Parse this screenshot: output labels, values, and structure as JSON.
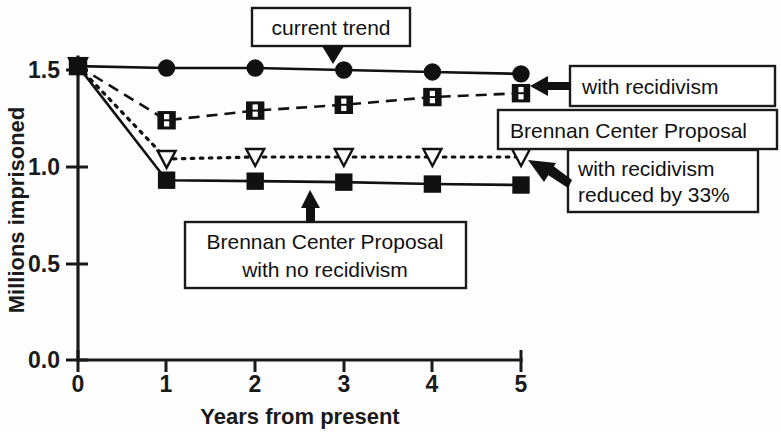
{
  "chart_data": {
    "type": "line",
    "title": "",
    "xlabel": "Years from present",
    "ylabel": "Millions imprisoned",
    "x": [
      0,
      1,
      2,
      3,
      4,
      5
    ],
    "xlim": [
      0,
      5
    ],
    "ylim": [
      0.0,
      1.6
    ],
    "xticks": [
      "0",
      "1",
      "2",
      "3",
      "4",
      "5"
    ],
    "yticks": [
      "0.0",
      "0.5",
      "1.0",
      "1.5"
    ],
    "ytick_values": [
      0.0,
      0.5,
      1.0,
      1.5
    ],
    "grid": false,
    "legend": "annotations",
    "series": [
      {
        "name": "current trend",
        "marker": "filled-circle",
        "linestyle": "solid",
        "values": [
          1.52,
          1.51,
          1.51,
          1.5,
          1.49,
          1.48
        ]
      },
      {
        "name": "Brennan Center Proposal with recidivism",
        "marker": "open-square-split",
        "linestyle": "dashed",
        "values": [
          1.52,
          1.24,
          1.29,
          1.32,
          1.36,
          1.38
        ]
      },
      {
        "name": "Brennan Center Proposal with recidivism reduced by 33%",
        "marker": "open-triangle-down",
        "linestyle": "dotted",
        "values": [
          1.52,
          1.04,
          1.05,
          1.05,
          1.05,
          1.05
        ]
      },
      {
        "name": "Brennan Center Proposal with no recidivism",
        "marker": "filled-square",
        "linestyle": "solid",
        "values": [
          1.52,
          0.93,
          0.925,
          0.92,
          0.91,
          0.905
        ]
      }
    ],
    "annotations": [
      {
        "id": "current-trend",
        "text": "current trend",
        "lines": [
          "current trend"
        ],
        "points_to": "current trend series"
      },
      {
        "id": "with-recidivism",
        "text": "with recidivism",
        "lines": [
          "with recidivism"
        ],
        "points_to": "Brennan Center Proposal with recidivism"
      },
      {
        "id": "brennan-center-proposal",
        "text": "Brennan Center Proposal",
        "lines": [
          "Brennan Center Proposal"
        ],
        "points_to": ""
      },
      {
        "id": "with-recidivism-reduced",
        "text": "with recidivism reduced by 33%",
        "lines": [
          "with recidivism",
          "reduced by 33%"
        ],
        "points_to": "Brennan Center Proposal with recidivism reduced by 33%"
      },
      {
        "id": "brennan-no-recidivism",
        "text": "Brennan Center Proposal with no recidivism",
        "lines": [
          "Brennan Center Proposal",
          "with no recidivism"
        ],
        "points_to": "Brennan Center Proposal with no recidivism"
      }
    ],
    "colors": {
      "ink": "#111111",
      "background": "#fefefe"
    }
  }
}
